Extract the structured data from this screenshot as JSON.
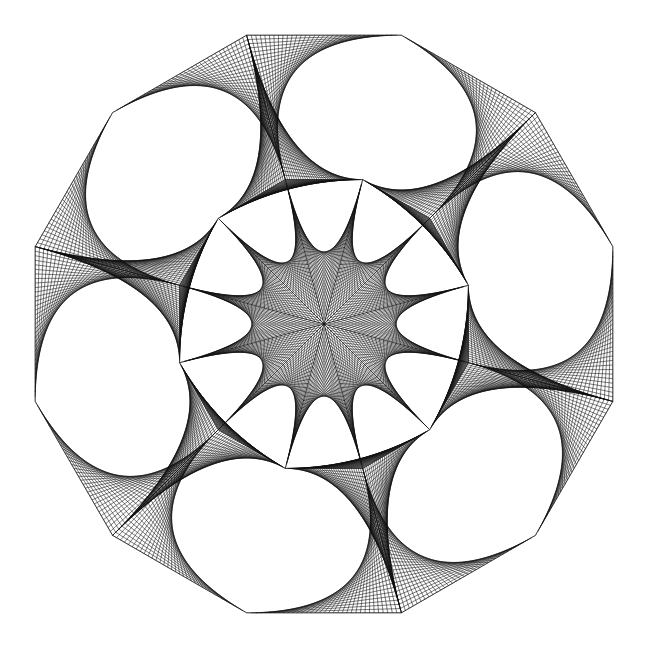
{
  "figure": {
    "type": "string-art",
    "width": 647,
    "height": 647,
    "background": "#ffffff",
    "stroke_color": "#111111",
    "stroke_width": 0.55,
    "center": [
      324,
      324
    ],
    "radius": 299,
    "polygon_sides": 12,
    "vertex_start_angle_deg": 15,
    "star_vertex_step": 2,
    "divisions": 34
  }
}
